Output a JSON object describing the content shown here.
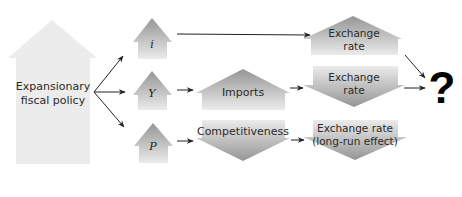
{
  "diagram": {
    "source": {
      "label_line1": "Expansionary",
      "label_line2": "fiscal policy",
      "direction": "up",
      "fill": "#ececec"
    },
    "variables": [
      {
        "id": "i",
        "label": "i",
        "direction": "up"
      },
      {
        "id": "Y",
        "label": "Y",
        "direction": "up"
      },
      {
        "id": "P",
        "label": "P",
        "direction": "up"
      }
    ],
    "intermediate": [
      {
        "id": "imports",
        "label": "Imports",
        "direction": "up"
      },
      {
        "id": "competitiveness",
        "label": "Competitiveness",
        "direction": "down"
      }
    ],
    "outcomes": [
      {
        "id": "er-interest",
        "label_line1": "Exchange",
        "label_line2": "rate",
        "direction": "up"
      },
      {
        "id": "er-income",
        "label_line1": "Exchange",
        "label_line2": "rate",
        "direction": "down"
      },
      {
        "id": "er-longrun",
        "label_line1": "Exchange rate",
        "label_line2": "(long-run effect)",
        "direction": "down"
      }
    ],
    "result": {
      "label": "?"
    },
    "colors": {
      "gradient_dark": "#9a9a9a",
      "gradient_light": "#e6e6e6",
      "connector": "#222222"
    }
  }
}
